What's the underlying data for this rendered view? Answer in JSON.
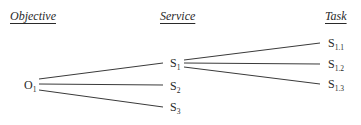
{
  "headers": {
    "objective": "Objective",
    "service": "Service",
    "task": "Task"
  },
  "nodes": {
    "o1": {
      "base": "O",
      "sub": "1"
    },
    "s1": {
      "base": "S",
      "sub": "1"
    },
    "s2": {
      "base": "S",
      "sub": "2"
    },
    "s3": {
      "base": "S",
      "sub": "3"
    },
    "s11": {
      "base": "S",
      "sub": "1.1"
    },
    "s12": {
      "base": "S",
      "sub": "1.2"
    },
    "s13": {
      "base": "S",
      "sub": "1.3"
    }
  },
  "edges": [
    {
      "from": "O1",
      "to": "S1"
    },
    {
      "from": "O1",
      "to": "S2"
    },
    {
      "from": "O1",
      "to": "S3"
    },
    {
      "from": "S1",
      "to": "S1.1"
    },
    {
      "from": "S1",
      "to": "S1.2"
    },
    {
      "from": "S1",
      "to": "S1.3"
    }
  ],
  "colors": {
    "line": "#3a3a3a",
    "text": "#2a2a2a",
    "background": "#ffffff"
  }
}
